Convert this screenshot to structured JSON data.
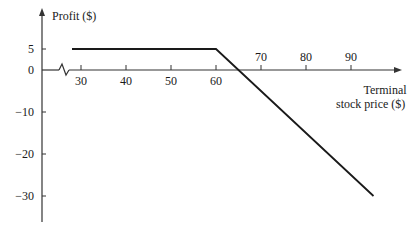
{
  "chart_data": {
    "type": "line",
    "title": "",
    "ylabel": "Profit ($)",
    "xlabel": "Terminal stock price ($)",
    "xlabel_lines": [
      "Terminal",
      "stock price ($)"
    ],
    "x_ticks": [
      30,
      40,
      50,
      60,
      70,
      80,
      90
    ],
    "y_ticks": [
      5,
      0,
      -10,
      -20,
      -30
    ],
    "xlim": [
      27,
      97
    ],
    "ylim": [
      -36,
      12
    ],
    "axis_break": true,
    "grid": false,
    "legend": null,
    "series": [
      {
        "name": "Profit",
        "x": [
          28,
          60,
          95
        ],
        "y": [
          5,
          5,
          -30
        ]
      }
    ],
    "annotations": []
  },
  "labels": {
    "y_axis_title": "Profit ($)",
    "x_axis_title_line1": "Terminal",
    "x_axis_title_line2": "stock price ($)"
  },
  "colors": {
    "line": "#1a1a1a",
    "axis": "#333333",
    "background": "#ffffff"
  }
}
